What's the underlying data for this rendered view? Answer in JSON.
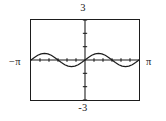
{
  "figure": {
    "kind": "graphing-calculator-viewing-window",
    "labels": {
      "y_max": "3",
      "y_min": "-3",
      "x_min": "−π",
      "x_max": "π"
    },
    "frame_color": "#1d1d1d",
    "curve_color": "#1d1d1d",
    "axis_color": "#1d1d1d",
    "background_color": "#ffffff"
  },
  "chart_data": {
    "type": "line",
    "title": "",
    "xlabel": "",
    "ylabel": "",
    "xlim": [
      -3.14159,
      3.14159
    ],
    "ylim": [
      -3,
      3
    ],
    "xtick_labels": [
      "−π",
      "π"
    ],
    "ytick_labels": [
      "3",
      "-3"
    ],
    "grid": false,
    "legend": "none",
    "axes_shown": [
      "x-axis",
      "y-axis"
    ],
    "tick_marks": {
      "x_axis_tick_spacing_units": 0.5235988,
      "y_axis_tick_spacing_units": 1
    },
    "series": [
      {
        "name": "y = 0.5 sin(2x)",
        "amplitude": 0.5,
        "period": 3.14159,
        "x": [
          -3.14159,
          -2.94524,
          -2.7489,
          -2.55255,
          -2.35619,
          -2.15984,
          -1.9635,
          -1.76715,
          -1.5708,
          -1.37445,
          -1.1781,
          -0.98175,
          -0.7854,
          -0.58905,
          -0.3927,
          -0.19635,
          0,
          0.19635,
          0.3927,
          0.58905,
          0.7854,
          0.98175,
          1.1781,
          1.37445,
          1.5708,
          1.76715,
          1.9635,
          2.15984,
          2.35619,
          2.55255,
          2.7489,
          2.94524,
          3.14159
        ],
        "y": [
          0,
          0.19134,
          0.35355,
          0.46194,
          0.5,
          0.46194,
          0.35355,
          0.19134,
          0,
          -0.19134,
          -0.35355,
          -0.46194,
          -0.5,
          -0.46194,
          -0.35355,
          -0.19134,
          0,
          0.19134,
          0.35355,
          0.46194,
          0.5,
          0.46194,
          0.35355,
          0.19134,
          0,
          -0.19134,
          -0.35355,
          -0.46194,
          -0.5,
          -0.46194,
          -0.35355,
          -0.19134,
          0
        ]
      }
    ]
  }
}
